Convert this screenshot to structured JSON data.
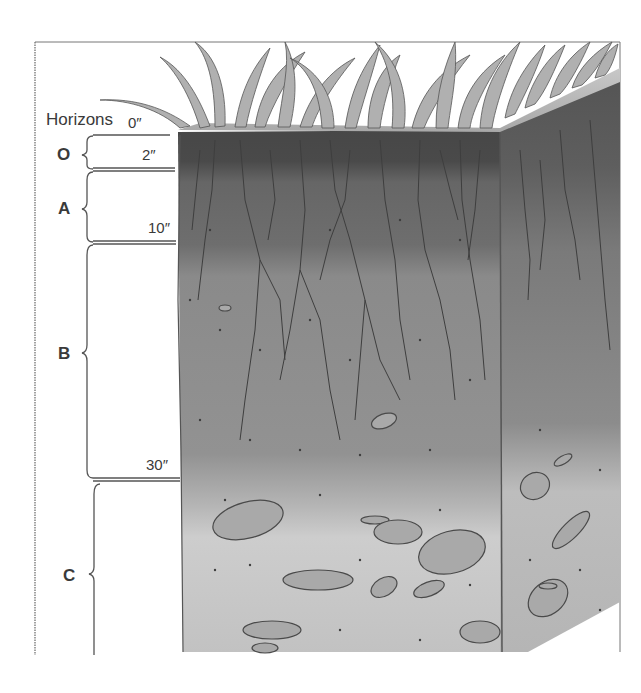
{
  "diagram": {
    "title": "Horizons",
    "depth_markers": [
      {
        "label": "0″",
        "depth_in": 0
      },
      {
        "label": "2″",
        "depth_in": 2
      },
      {
        "label": "10″",
        "depth_in": 10
      },
      {
        "label": "30″",
        "depth_in": 30
      }
    ],
    "horizons": [
      {
        "label": "O",
        "top_in": 0,
        "bottom_in": 2,
        "description": "dark organic layer beneath grass"
      },
      {
        "label": "A",
        "top_in": 2,
        "bottom_in": 10,
        "description": "dark topsoil with dense roots"
      },
      {
        "label": "B",
        "top_in": 10,
        "bottom_in": 30,
        "description": "subsoil with deep roots and specks"
      },
      {
        "label": "C",
        "top_in": 30,
        "bottom_in": null,
        "description": "light weathered layer with rock fragments"
      }
    ],
    "colors": {
      "ink": "#3a3a3a",
      "grass": "#9a9a9a",
      "o_layer": "#4a4a4a",
      "a_layer": "#6a6a6a",
      "b_layer": "#8e8e8e",
      "c_layer": "#c4c4c4",
      "rock": "#a8a8a8",
      "frame": "#555555"
    }
  }
}
